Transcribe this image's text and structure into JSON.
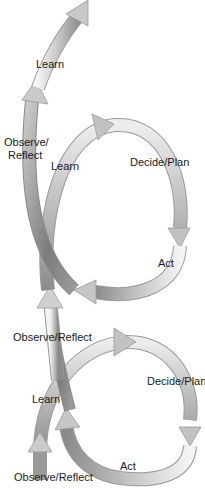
{
  "diagram": {
    "type": "spiral-learning-loop",
    "colors": {
      "arrow_light": "#f2f2f2",
      "arrow_mid": "#b8b8b8",
      "arrow_dark": "#7a7a7a",
      "arrow_edge": "#9a9a9a",
      "text": "#1a1a1a",
      "background": "#ffffff"
    },
    "labels": {
      "top_learn": "Learn",
      "upper_observe_line1": "Observe/",
      "upper_observe_line2": "Reflect",
      "upper_learn": "Learn",
      "upper_decide": "Decide/Plan",
      "upper_act": "Act",
      "middle_observe": "Observe/Reflect",
      "lower_learn": "Learn",
      "lower_decide": "Decide/Plan",
      "lower_act": "Act",
      "bottom_observe": "Observe/Reflect"
    },
    "loops": [
      {
        "name": "upper-loop",
        "steps": [
          "Observe/Reflect",
          "Learn",
          "Decide/Plan",
          "Act"
        ]
      },
      {
        "name": "lower-loop",
        "steps": [
          "Observe/Reflect",
          "Learn",
          "Decide/Plan",
          "Act"
        ]
      }
    ],
    "exit_arrow": {
      "direction": "up-right",
      "label": "Learn"
    }
  }
}
